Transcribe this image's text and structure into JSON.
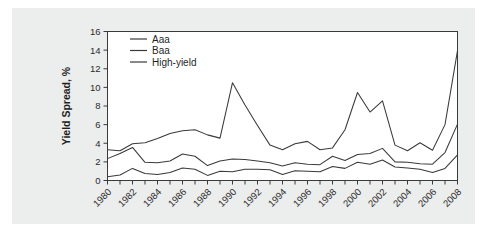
{
  "chart_data": {
    "type": "line",
    "title": "",
    "xlabel": "",
    "ylabel": "Yield Spread, %",
    "ylim": [
      0,
      16
    ],
    "xlim": [
      1980,
      2008
    ],
    "yticks": [
      0,
      2,
      4,
      6,
      8,
      10,
      12,
      14,
      16
    ],
    "ytick_labels": [
      "0",
      "2",
      "4",
      "6",
      "8",
      "10",
      "12",
      "14",
      "16"
    ],
    "xticks": [
      1980,
      1982,
      1984,
      1986,
      1988,
      1990,
      1992,
      1994,
      1996,
      1998,
      2000,
      2002,
      2004,
      2006,
      2008
    ],
    "xtick_labels": [
      "1980",
      "1982",
      "1984",
      "1986",
      "1988",
      "1990",
      "1992",
      "1994",
      "1996",
      "1998",
      "2000",
      "2002",
      "2004",
      "2006",
      "2008"
    ],
    "x": [
      1980,
      1981,
      1982,
      1983,
      1984,
      1985,
      1986,
      1987,
      1988,
      1989,
      1990,
      1991,
      1992,
      1993,
      1994,
      1995,
      1996,
      1997,
      1998,
      1999,
      2000,
      2001,
      2002,
      2003,
      2004,
      2005,
      2006,
      2007,
      2008
    ],
    "grid": false,
    "legend_position": "top-left",
    "series": [
      {
        "name": "Aaa",
        "color": "#3a3a3a",
        "values": [
          0.4,
          0.6,
          0.8,
          1.3,
          0.8,
          0.7,
          0.9,
          1.4,
          1.3,
          0.9,
          0.55,
          1.05,
          1.0,
          0.95,
          1.2,
          1.2,
          1.15,
          1.1,
          0.7,
          1.25,
          1.45,
          1.1,
          1.5,
          1.95,
          1.35,
          1.6,
          2.15,
          1.9,
          1.75
        ]
      },
      {
        "name": "Baa",
        "color": "#3a3a3a",
        "values": [
          2.35,
          2.9,
          3.55,
          2.75,
          1.95,
          1.95,
          2.35,
          2.85,
          2.3,
          1.65,
          1.55,
          2.1,
          2.3,
          2.4,
          2.1,
          2.0,
          1.8,
          1.95,
          1.75,
          2.0,
          2.1,
          2.6,
          2.2,
          2.35,
          2.8,
          2.55,
          3.1,
          2.45,
          2.65
        ]
      },
      {
        "name": "High-yield",
        "color": "#3a3a3a",
        "values": [
          3.3,
          3.2,
          3.75,
          4.05,
          3.85,
          5.05,
          3.7,
          3.95,
          4.35,
          5.05,
          5.45,
          5.1,
          4.9,
          4.55,
          6.8,
          8.55,
          10.5,
          8.1,
          5.9,
          3.8,
          3.95,
          4.1,
          3.3,
          3.6,
          3.95,
          4.2,
          3.5,
          3.3,
          3.45
        ]
      }
    ],
    "series_plot": {
      "Aaa": [
        0.4,
        0.6,
        0.8,
        1.3,
        0.8,
        0.7,
        0.9,
        1.4,
        1.3,
        0.9,
        0.55,
        1.05,
        1.0,
        1.2,
        1.2,
        1.2,
        1.15,
        0.65,
        1.05,
        1.0,
        0.95,
        1.5,
        1.3,
        1.95,
        1.55,
        1.75,
        2.2,
        1.45,
        1.35,
        1.2,
        0.85,
        0.8,
        1.3,
        2.75
      ],
      "Baa": [
        2.35,
        2.9,
        3.55,
        2.75,
        1.95,
        1.95,
        2.35,
        2.85,
        2.3,
        1.65,
        1.55,
        2.1,
        2.3,
        2.4,
        2.1,
        2.0,
        1.8,
        1.95,
        1.75,
        2.0,
        2.1,
        2.6,
        2.2,
        2.35,
        2.8,
        2.55,
        3.1,
        2.45,
        2.65
      ],
      "High-yield": [
        3.3,
        3.2,
        3.75,
        4.05,
        3.85,
        5.05,
        3.7,
        3.95,
        4.35,
        5.05,
        5.45,
        5.1,
        4.9,
        4.55,
        6.8,
        8.55,
        10.5,
        8.1,
        5.9,
        3.8,
        3.95,
        4.1,
        3.3,
        3.6,
        3.95,
        4.2,
        3.5,
        3.3,
        3.45
      ]
    },
    "data_table": {
      "columns": [
        "Year",
        "Aaa",
        "Baa",
        "High-yield"
      ],
      "rows": [
        [
          1980,
          0.4,
          2.35,
          3.3
        ],
        [
          1981,
          0.6,
          2.9,
          3.2
        ],
        [
          1982,
          1.3,
          3.55,
          3.95
        ],
        [
          1983,
          0.75,
          1.95,
          4.05
        ],
        [
          1984,
          0.65,
          1.9,
          4.5
        ],
        [
          1985,
          0.85,
          2.1,
          5.05
        ],
        [
          1986,
          1.35,
          2.85,
          5.35
        ],
        [
          1987,
          1.2,
          2.6,
          5.45
        ],
        [
          1988,
          0.55,
          1.6,
          4.9
        ],
        [
          1989,
          1.0,
          2.1,
          4.55
        ],
        [
          1990,
          0.95,
          2.3,
          10.5
        ],
        [
          1991,
          1.2,
          2.25,
          8.1
        ],
        [
          1992,
          1.2,
          2.1,
          5.9
        ],
        [
          1993,
          1.15,
          1.9,
          3.8
        ],
        [
          1994,
          0.65,
          1.55,
          3.3
        ],
        [
          1995,
          1.05,
          1.9,
          3.95
        ],
        [
          1996,
          1.0,
          1.75,
          4.2
        ],
        [
          1997,
          0.95,
          1.7,
          3.3
        ],
        [
          1998,
          1.5,
          2.6,
          3.5
        ],
        [
          1999,
          1.3,
          2.15,
          5.45
        ],
        [
          2000,
          1.95,
          2.8,
          9.45
        ],
        [
          2001,
          1.75,
          2.9,
          7.35
        ],
        [
          2002,
          2.2,
          3.45,
          8.55
        ],
        [
          2003,
          1.45,
          2.0,
          3.8
        ],
        [
          2004,
          1.35,
          1.95,
          3.2
        ],
        [
          2005,
          1.2,
          1.8,
          4.05
        ],
        [
          2006,
          0.85,
          1.75,
          3.25
        ],
        [
          2007,
          1.3,
          3.0,
          6.0
        ],
        [
          2008,
          2.75,
          6.05,
          13.95
        ]
      ]
    },
    "legend": [
      {
        "label": "Aaa",
        "color": "#3a3a3a"
      },
      {
        "label": "Baa",
        "color": "#3a3a3a"
      },
      {
        "label": "High-yield",
        "color": "#3a3a3a"
      }
    ],
    "colors": {
      "plot_background": "#ffffff",
      "page_background": "#eceded",
      "axis": "#3a3a3a",
      "text": "#1f1f1f",
      "line": "#3a3a3a"
    }
  }
}
